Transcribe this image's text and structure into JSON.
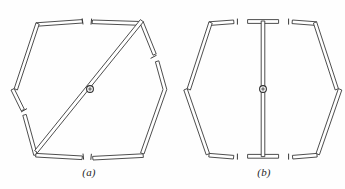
{
  "figure": {
    "background_color": "#fefefe",
    "line_color": "#3a3a3a",
    "pivot_color": "#7a7a7a",
    "width": 345,
    "height": 189
  },
  "panels": [
    {
      "id": "a",
      "label": "(a)",
      "label_x": 89,
      "label_y": 172,
      "configuration": "hexagon with a long diagonal member running from the upper-right vertex through the central pivot to the lower-left vertex",
      "members": 7,
      "pivot": {
        "cx": 90,
        "cy": 89,
        "r_outer": 3.4,
        "r_inner": 1.7
      },
      "breaks": 4,
      "break_positions": [
        "top-center",
        "bottom-center",
        "left-lower-edge",
        "right-upper-edge"
      ]
    },
    {
      "id": "b",
      "label": "(b)",
      "label_x": 264,
      "label_y": 172,
      "configuration": "hexagon with a vertical member on the axis of symmetry running from the top-center T-joint through the central pivot to the bottom-center T-joint",
      "members": 7,
      "pivot": {
        "cx": 263,
        "cy": 89,
        "r_outer": 3.4,
        "r_inner": 1.7
      },
      "breaks": 4,
      "break_positions": [
        "top-left-of-center",
        "top-right-of-center",
        "bottom-left-of-center",
        "bottom-right-of-center"
      ]
    }
  ],
  "geometry": {
    "hex_a": {
      "vertices": [
        {
          "name": "top-left",
          "x": 36,
          "y": 22
        },
        {
          "name": "top-right",
          "x": 144,
          "y": 22
        },
        {
          "name": "right",
          "x": 167,
          "y": 90
        },
        {
          "name": "bottom-right",
          "x": 144,
          "y": 156
        },
        {
          "name": "bottom-left",
          "x": 36,
          "y": 156
        },
        {
          "name": "left",
          "x": 13,
          "y": 90
        }
      ],
      "diagonal": {
        "from": "top-right",
        "to": "bottom-left"
      }
    },
    "hex_b": {
      "vertices": [
        {
          "name": "top-left",
          "x": 209,
          "y": 22
        },
        {
          "name": "top-right",
          "x": 317,
          "y": 22
        },
        {
          "name": "right",
          "x": 340,
          "y": 90
        },
        {
          "name": "bottom-right",
          "x": 317,
          "y": 156
        },
        {
          "name": "bottom-left",
          "x": 209,
          "y": 156
        },
        {
          "name": "left",
          "x": 186,
          "y": 90
        }
      ],
      "vertical": {
        "from": "top-center",
        "to": "bottom-center",
        "x": 263
      }
    }
  }
}
